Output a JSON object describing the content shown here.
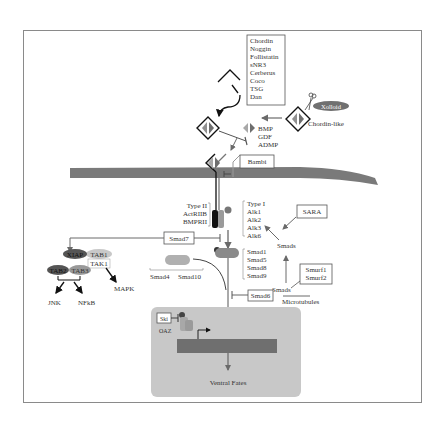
{
  "colors": {
    "membrane": "#7a7a7a",
    "nucleus": "#c8c8c8",
    "dna": "#6f6f6f",
    "ligand_light": "#b0b0b0",
    "ligand_dark": "#707070",
    "smad_blob": "#8a8a8a",
    "xiap": "#555555",
    "frame": "#888888"
  },
  "antagonists": [
    "Chordin",
    "Noggin",
    "Follistatin",
    "sNR3",
    "Cerberus",
    "Coco",
    "TSG",
    "Dan"
  ],
  "ligands": [
    "BMP",
    "GDF",
    "ADMP"
  ],
  "xolloid": "Xolloid",
  "chordin_like": "Chordin-like",
  "bambi": "Bambi",
  "type2": [
    "Type II",
    "ActRIIB",
    "BMPRII"
  ],
  "type1": [
    "Type I",
    "Alk1",
    "Alk2",
    "Alk3",
    "Alk6"
  ],
  "sara": "SARA",
  "smads_top": "Smads",
  "smads_bottom": "Smads",
  "microtubules": "Microtubules",
  "smurf": [
    "Smurf1",
    "Smurf2"
  ],
  "smad7": "Smad7",
  "smad6": "Smad6",
  "rsmads": [
    "Smad1",
    "Smad5",
    "Smad8",
    "Smad9"
  ],
  "cosmads": [
    "Smad4",
    "Smad10"
  ],
  "xiap": "XIAP",
  "tab1": "TAB1",
  "tak1": "TAK1",
  "tab2": "TAB2",
  "tab3": "TAB3",
  "mapk": "MAPK",
  "jnk": "JNK",
  "nfkb": "NFkB",
  "ski": "Ski",
  "oaz": "OAZ",
  "phospho": "P",
  "ventral_fates": "Ventral Fates"
}
